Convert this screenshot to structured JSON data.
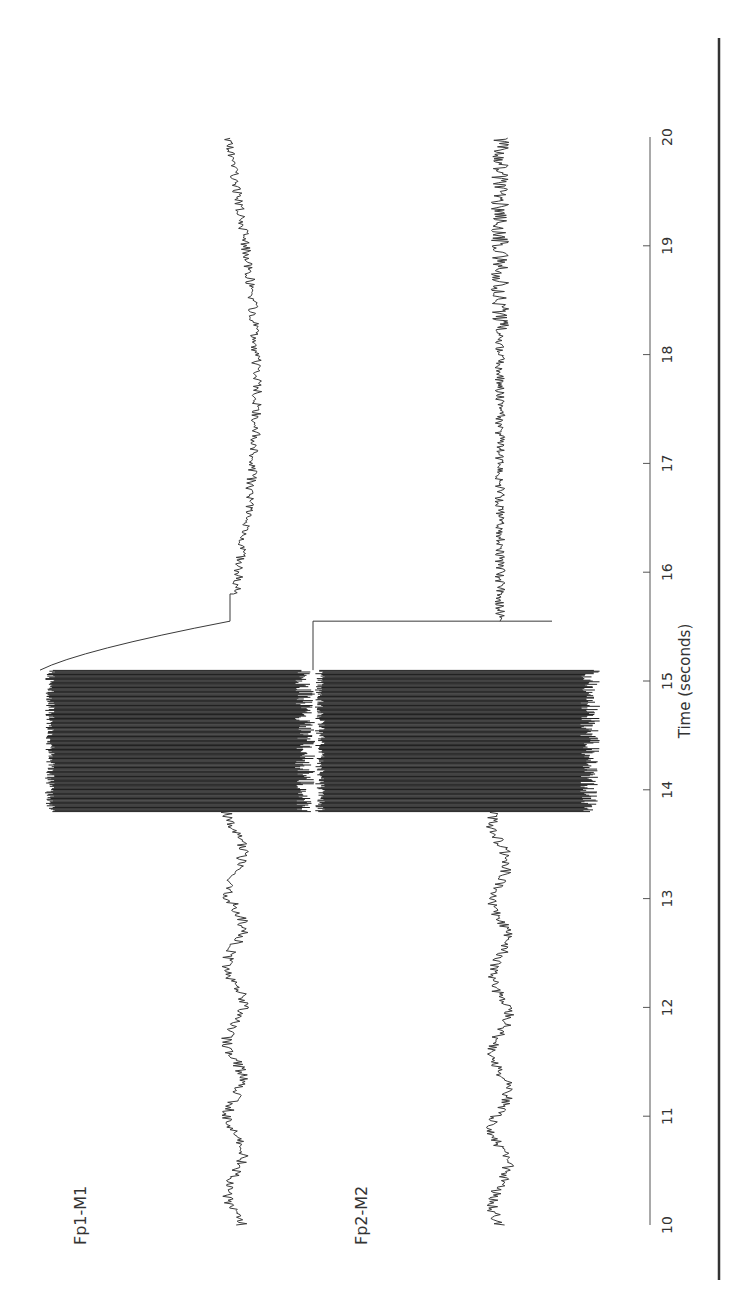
{
  "chart_data": {
    "type": "line",
    "orientation": "rotated-90-ccw",
    "title": "",
    "xlabel": "Time (seconds)",
    "ylabel": "",
    "xlim": [
      10,
      20
    ],
    "x_ticks": [
      10,
      11,
      12,
      13,
      14,
      15,
      16,
      17,
      18,
      19,
      20
    ],
    "grid": false,
    "legend": "none (channel labels placed beside traces)",
    "series": [
      {
        "name": "Fp1-M1",
        "description": "Baseline EEG 10-13.8 s; high-amplitude saturating artifact burst 13.8-15.1 s; overshoot then DC step and slow drift recovery 15.1-16 s; slow wave with superimposed fast activity 16-20 s",
        "segments": [
          {
            "t": [
              10.0,
              13.8
            ],
            "kind": "eeg",
            "offset": 0,
            "amp": 6
          },
          {
            "t": [
              13.8,
              15.1
            ],
            "kind": "artifact-burst",
            "amp": "saturated"
          },
          {
            "t": [
              15.1,
              15.55
            ],
            "kind": "step-decay",
            "offset": 95
          },
          {
            "t": [
              15.55,
              15.8
            ],
            "kind": "plateau",
            "offset": -12
          },
          {
            "t": [
              15.8,
              20.0
            ],
            "kind": "slow-wave",
            "offset": 30,
            "amp": 4
          }
        ]
      },
      {
        "name": "Fp2-M2",
        "description": "Baseline EEG 10-13.8 s; saturating artifact burst 13.8-15.1 s; DC step 15.1-15.55 s; recovery with fast activity 15.55-20 s",
        "segments": [
          {
            "t": [
              10.0,
              13.8
            ],
            "kind": "eeg",
            "offset": 0,
            "amp": 6
          },
          {
            "t": [
              13.8,
              15.1
            ],
            "kind": "artifact-burst",
            "amp": "saturated"
          },
          {
            "t": [
              15.1,
              15.55
            ],
            "kind": "step",
            "offset": 68
          },
          {
            "t": [
              15.55,
              20.0
            ],
            "kind": "eeg-fast",
            "offset": 0,
            "amp": 7
          }
        ]
      }
    ],
    "annotations": []
  },
  "figure": {
    "labels": {
      "ch1": "Fp1-M1",
      "ch2": "Fp2-M2",
      "axis": "Time (seconds)"
    },
    "ticks": [
      "10",
      "11",
      "12",
      "13",
      "14",
      "15",
      "16",
      "17",
      "18",
      "19",
      "20"
    ],
    "colors": {
      "trace": "#3a3a3a",
      "burst": "#222222",
      "axis": "#555555",
      "rule": "#333333",
      "background": "#ffffff"
    }
  }
}
